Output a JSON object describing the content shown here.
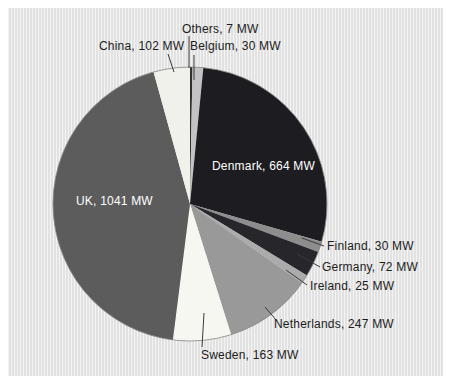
{
  "page": {
    "background": "#ffffff",
    "panel_background": "#e6e6e6"
  },
  "chart_data": {
    "type": "pie",
    "title": "",
    "unit": "MW",
    "total": 2381,
    "start_angle_deg": 0,
    "direction": "clockwise",
    "legend_position": "callout-labels",
    "slices": [
      {
        "label": "Others",
        "value": 7,
        "display": "Others, 7 MW",
        "color": "#2f2f2f"
      },
      {
        "label": "Belgium",
        "value": 30,
        "display": "Belgium, 30 MW",
        "color": "#c3c3c3"
      },
      {
        "label": "Denmark",
        "value": 664,
        "display": "Denmark, 664 MW",
        "color": "#1d1d21"
      },
      {
        "label": "Finland",
        "value": 30,
        "display": "Finland, 30 MW",
        "color": "#8d8d8d"
      },
      {
        "label": "Germany",
        "value": 72,
        "display": "Germany, 72 MW",
        "color": "#26262b"
      },
      {
        "label": "Ireland",
        "value": 25,
        "display": "Ireland, 25 MW",
        "color": "#ababab"
      },
      {
        "label": "Netherlands",
        "value": 247,
        "display": "Netherlands, 247 MW",
        "color": "#999999"
      },
      {
        "label": "Sweden",
        "value": 163,
        "display": "Sweden, 163 MW",
        "color": "#f7f7f2"
      },
      {
        "label": "UK",
        "value": 1041,
        "display": "UK, 1041 MW",
        "color": "#5c5c5c"
      },
      {
        "label": "China",
        "value": 102,
        "display": "China, 102 MW",
        "color": "#f1f1ec"
      }
    ]
  }
}
